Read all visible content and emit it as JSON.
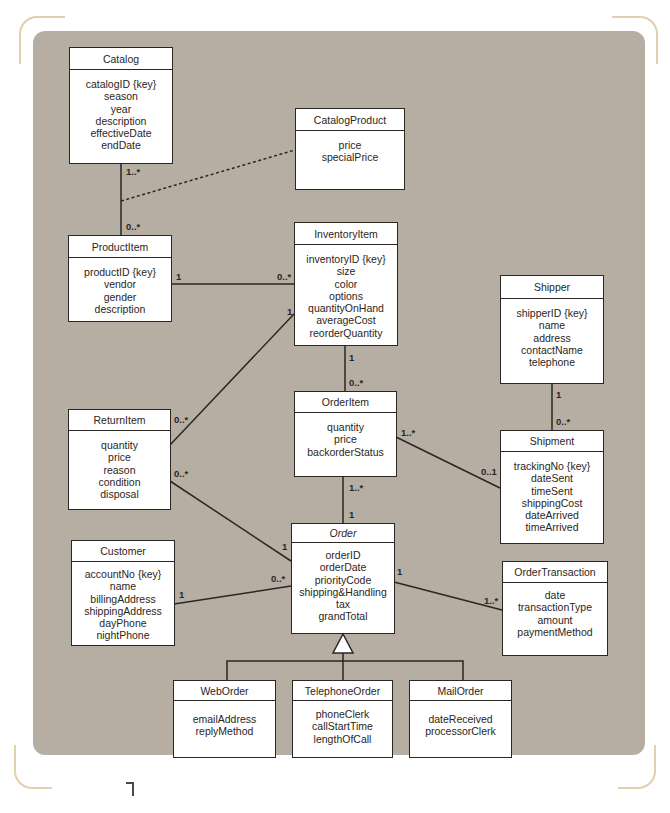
{
  "diagram": {
    "type": "UML class diagram",
    "background_color": "#b6aea3",
    "frame_accent_color": "#e2cfae",
    "line_color": "#2b2622"
  },
  "classes": {
    "catalog": {
      "name": "Catalog",
      "attributes": [
        "catalogID {key}",
        "season",
        "year",
        "description",
        "effectiveDate",
        "endDate"
      ]
    },
    "catalog_product": {
      "name": "CatalogProduct",
      "attributes": [
        "price",
        "specialPrice"
      ]
    },
    "product_item": {
      "name": "ProductItem",
      "attributes": [
        "productID {key}",
        "vendor",
        "gender",
        "description"
      ]
    },
    "inventory_item": {
      "name": "InventoryItem",
      "attributes": [
        "inventoryID {key}",
        "size",
        "color",
        "options",
        "quantityOnHand",
        "averageCost",
        "reorderQuantity"
      ]
    },
    "shipper": {
      "name": "Shipper",
      "attributes": [
        "shipperID {key}",
        "name",
        "address",
        "contactName",
        "telephone"
      ]
    },
    "return_item": {
      "name": "ReturnItem",
      "attributes": [
        "quantity",
        "price",
        "reason",
        "condition",
        "disposal"
      ]
    },
    "order_item": {
      "name": "OrderItem",
      "attributes": [
        "quantity",
        "price",
        "backorderStatus"
      ]
    },
    "shipment": {
      "name": "Shipment",
      "attributes": [
        "trackingNo {key}",
        "dateSent",
        "timeSent",
        "shippingCost",
        "dateArrived",
        "timeArrived"
      ]
    },
    "customer": {
      "name": "Customer",
      "attributes": [
        "accountNo {key}",
        "name",
        "billingAddress",
        "shippingAddress",
        "dayPhone",
        "nightPhone"
      ]
    },
    "order": {
      "name": "Order",
      "abstract": true,
      "attributes": [
        "orderID",
        "orderDate",
        "priorityCode",
        "shipping&Handling",
        "tax",
        "grandTotal"
      ]
    },
    "order_transaction": {
      "name": "OrderTransaction",
      "attributes": [
        "date",
        "transactionType",
        "amount",
        "paymentMethod"
      ]
    },
    "web_order": {
      "name": "WebOrder",
      "attributes": [
        "emailAddress",
        "replyMethod"
      ]
    },
    "telephone_order": {
      "name": "TelephoneOrder",
      "attributes": [
        "phoneClerk",
        "callStartTime",
        "lengthOfCall"
      ]
    },
    "mail_order": {
      "name": "MailOrder",
      "attributes": [
        "dateReceived",
        "processorClerk"
      ]
    }
  },
  "associations": [
    {
      "from": "Catalog",
      "to": "ProductItem",
      "from_mult": "1..*",
      "to_mult": "0..*"
    },
    {
      "from": "Catalog-ProductItem",
      "to": "CatalogProduct",
      "style": "dashed",
      "kind": "association class"
    },
    {
      "from": "ProductItem",
      "to": "InventoryItem",
      "from_mult": "1",
      "to_mult": "0..*"
    },
    {
      "from": "InventoryItem",
      "to": "ReturnItem",
      "from_mult": "1",
      "to_mult": "0..*"
    },
    {
      "from": "InventoryItem",
      "to": "OrderItem",
      "from_mult": "1",
      "to_mult": "0..*"
    },
    {
      "from": "Shipper",
      "to": "Shipment",
      "from_mult": "1",
      "to_mult": "0..*"
    },
    {
      "from": "OrderItem",
      "to": "Shipment",
      "from_mult": "1..*",
      "to_mult": "0..1"
    },
    {
      "from": "OrderItem",
      "to": "Order",
      "from_mult": "1..*",
      "to_mult": "1"
    },
    {
      "from": "ReturnItem",
      "to": "Order",
      "from_mult": "0..*",
      "to_mult": "1"
    },
    {
      "from": "Customer",
      "to": "Order",
      "from_mult": "1",
      "to_mult": "0..*"
    },
    {
      "from": "Order",
      "to": "OrderTransaction",
      "from_mult": "1",
      "to_mult": "1..*"
    },
    {
      "from": "WebOrder",
      "to": "Order",
      "kind": "generalization"
    },
    {
      "from": "TelephoneOrder",
      "to": "Order",
      "kind": "generalization"
    },
    {
      "from": "MailOrder",
      "to": "Order",
      "kind": "generalization"
    }
  ],
  "multiplicities": {
    "catalog_top": "1..*",
    "product_item_top": "0..*",
    "product_item_right": "1",
    "inventory_item_left": "0..*",
    "inventory_item_to_return": "1",
    "inventory_item_bottom": "1",
    "order_item_top": "0..*",
    "return_item_upper": "0..*",
    "return_item_lower": "0..*",
    "shipper_bottom": "1",
    "shipment_top": "0..*",
    "order_item_right": "1..*",
    "shipment_left": "0..1",
    "order_item_bottom": "1..*",
    "order_top": "1",
    "order_from_return": "1",
    "order_from_customer": "0..*",
    "customer_right": "1",
    "order_right": "1",
    "order_transaction_left": "1..*"
  }
}
